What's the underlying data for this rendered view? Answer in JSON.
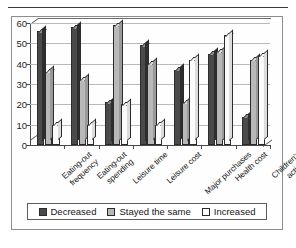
{
  "chart_data": {
    "type": "bar",
    "title": "",
    "xlabel": "",
    "ylabel": "",
    "ylim": [
      0,
      60
    ],
    "yticks": [
      0,
      10,
      20,
      30,
      40,
      50,
      60
    ],
    "grid": true,
    "legend_position": "bottom",
    "categories": [
      "Eating-out\nfrequency",
      "Eating-out\nspending",
      "Leisure time",
      "Leisure cost",
      "Major purchases",
      "Health cost",
      "Children's activity"
    ],
    "series": [
      {
        "name": "Decreased",
        "color": "#4a4a4a",
        "values": [
          56,
          58,
          21,
          49,
          37,
          45,
          14
        ]
      },
      {
        "name": "Stayed the same",
        "color": "#b8b8b8",
        "values": [
          36,
          32,
          59,
          40,
          21,
          46,
          42
        ]
      },
      {
        "name": "Increased",
        "color": "#ffffff",
        "values": [
          10,
          10,
          20,
          10,
          42,
          54,
          44
        ]
      }
    ]
  },
  "legend": {
    "items": [
      {
        "label": "Decreased",
        "swatch": "dark-gray-swatch-icon"
      },
      {
        "label": "Stayed the same",
        "swatch": "light-gray-swatch-icon"
      },
      {
        "label": "Increased",
        "swatch": "white-swatch-icon"
      }
    ]
  },
  "axis": {
    "y_tick_labels": [
      "60",
      "50",
      "40",
      "30",
      "20",
      "10",
      "0"
    ]
  }
}
